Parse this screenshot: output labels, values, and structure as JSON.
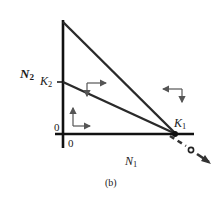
{
  "figure": {
    "caption": "(b)",
    "axes": {
      "x_label": "N",
      "x_label_sub": "1",
      "y_label": "N",
      "y_label_sub": "2",
      "origin_x_label": "0",
      "origin_y_label": "0"
    },
    "intercepts": {
      "k2_label": "K",
      "k2_sub": "2",
      "k1_label": "K",
      "k1_sub": "1"
    },
    "colors": {
      "line": "#1a1a1a",
      "arrow": "#555555",
      "background": "#ffffff"
    }
  }
}
